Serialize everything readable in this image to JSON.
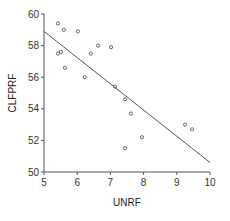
{
  "chart_data": {
    "type": "scatter",
    "title": "",
    "xlabel": "UNRF",
    "ylabel": "CLFPRF",
    "xlim": [
      5,
      10
    ],
    "ylim": [
      50,
      60
    ],
    "xticks": [
      5,
      6,
      7,
      8,
      9,
      10
    ],
    "yticks": [
      50,
      52,
      54,
      56,
      58,
      60
    ],
    "grid": false,
    "legend": null,
    "series": [
      {
        "name": "observations",
        "marker": "open-circle",
        "points": [
          {
            "x": 5.42,
            "y": 59.4
          },
          {
            "x": 5.6,
            "y": 59.0
          },
          {
            "x": 6.02,
            "y": 58.9
          },
          {
            "x": 5.42,
            "y": 57.5
          },
          {
            "x": 5.51,
            "y": 57.6
          },
          {
            "x": 5.63,
            "y": 56.6
          },
          {
            "x": 6.23,
            "y": 56.0
          },
          {
            "x": 6.41,
            "y": 57.5
          },
          {
            "x": 6.63,
            "y": 58.0
          },
          {
            "x": 7.02,
            "y": 57.9
          },
          {
            "x": 7.14,
            "y": 55.4
          },
          {
            "x": 7.44,
            "y": 54.6
          },
          {
            "x": 7.62,
            "y": 53.7
          },
          {
            "x": 7.44,
            "y": 51.5
          },
          {
            "x": 7.95,
            "y": 52.2
          },
          {
            "x": 9.25,
            "y": 53.0
          },
          {
            "x": 9.46,
            "y": 52.7
          }
        ]
      },
      {
        "name": "fitted line",
        "type": "line",
        "points": [
          {
            "x": 5,
            "y": 58.9
          },
          {
            "x": 10,
            "y": 50.6
          }
        ]
      }
    ]
  },
  "colors": {
    "axis": "#555555",
    "marker": "#555555",
    "line": "#555555",
    "text": "#333333"
  },
  "plot_area": {
    "left": 44,
    "right": 210,
    "top": 14,
    "bottom": 172
  }
}
